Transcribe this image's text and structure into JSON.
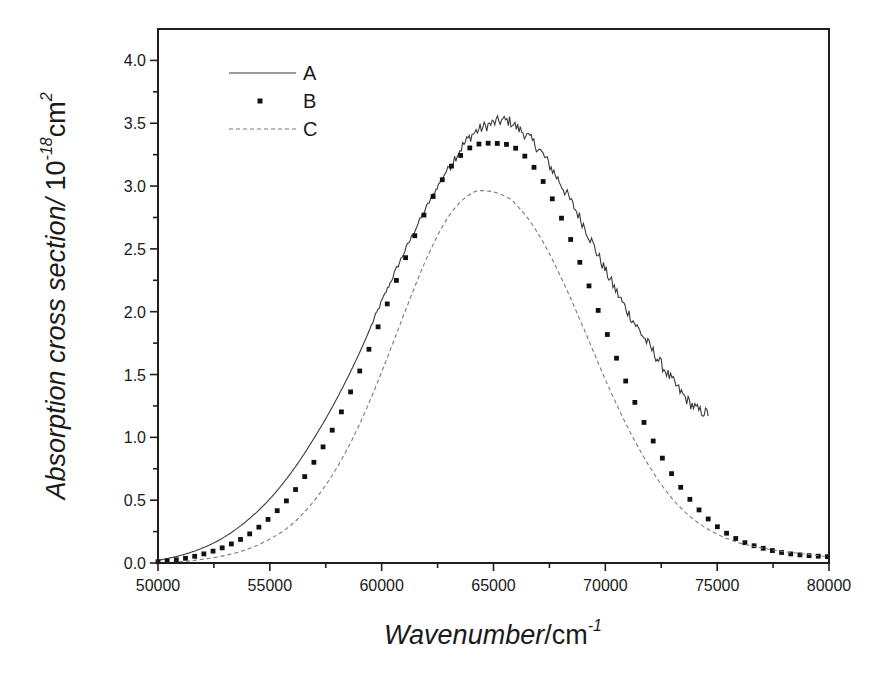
{
  "chart_data": {
    "type": "line",
    "title": "",
    "xlabel": "Wavenumber/cm⁻¹",
    "xlabel_parts": {
      "italic": "Wavenumber",
      "unit": "/cm",
      "sup": "-1"
    },
    "ylabel": "Absorption cross section/ 10⁻¹⁸cm²",
    "ylabel_parts": {
      "italic": "Absorption cross section/",
      "unit": " 10",
      "sup1": "-18",
      "unit2": "cm",
      "sup2": "2"
    },
    "xlim": [
      50000,
      80000
    ],
    "ylim": [
      0.0,
      4.25
    ],
    "x_ticks": [
      50000,
      55000,
      60000,
      65000,
      70000,
      75000,
      80000
    ],
    "x_tick_labels": [
      "50000",
      "55000",
      "60000",
      "65000",
      "70000",
      "75000",
      "80000"
    ],
    "x_minor_step": 2500,
    "y_ticks": [
      0.0,
      0.5,
      1.0,
      1.5,
      2.0,
      2.5,
      3.0,
      3.5,
      4.0
    ],
    "y_tick_labels": [
      "0.0",
      "0.5",
      "1.0",
      "1.5",
      "2.0",
      "2.5",
      "3.0",
      "3.5",
      "4.0"
    ],
    "y_minor_step": 0.25,
    "grid": false,
    "legend_position": "upper-left",
    "series": [
      {
        "name": "A",
        "style": "solid-noisy",
        "color": "#3a3a3a",
        "x": [
          50000,
          51000,
          52000,
          53000,
          54000,
          55000,
          56000,
          57000,
          58000,
          59000,
          60000,
          61000,
          62000,
          63000,
          64000,
          65000,
          65600,
          66000,
          67000,
          68000,
          69000,
          70000,
          71000,
          72000,
          73000,
          74000,
          74600
        ],
        "y": [
          0.02,
          0.06,
          0.12,
          0.21,
          0.34,
          0.51,
          0.73,
          1.0,
          1.31,
          1.67,
          2.08,
          2.47,
          2.83,
          3.15,
          3.4,
          3.5,
          3.52,
          3.47,
          3.3,
          3.02,
          2.7,
          2.33,
          2.0,
          1.72,
          1.45,
          1.24,
          1.19
        ]
      },
      {
        "name": "B",
        "style": "square-markers",
        "color": "#111111",
        "x": [
          50000,
          51000,
          52000,
          53000,
          54000,
          55000,
          56000,
          57000,
          58000,
          59000,
          60000,
          61000,
          62000,
          63000,
          64000,
          65000,
          66000,
          67000,
          68000,
          69000,
          70000,
          71000,
          72000,
          73000,
          74000,
          75000,
          76000,
          77000,
          78000,
          79000,
          80000
        ],
        "y": [
          0.01,
          0.03,
          0.07,
          0.13,
          0.22,
          0.36,
          0.55,
          0.81,
          1.13,
          1.52,
          1.95,
          2.4,
          2.81,
          3.13,
          3.31,
          3.34,
          3.3,
          3.1,
          2.76,
          2.33,
          1.86,
          1.41,
          1.02,
          0.7,
          0.46,
          0.29,
          0.18,
          0.12,
          0.08,
          0.06,
          0.05
        ]
      },
      {
        "name": "C",
        "style": "dashed",
        "color": "#7a7a7a",
        "x": [
          50000,
          51000,
          52000,
          53000,
          54000,
          55000,
          56000,
          57000,
          58000,
          59000,
          60000,
          61000,
          62000,
          63000,
          64000,
          64800,
          65500,
          66000,
          67000,
          68000,
          69000,
          70000,
          71000,
          72000,
          73000,
          74000,
          75000,
          76000,
          77000,
          78000,
          79000,
          80000
        ],
        "y": [
          0.0,
          0.01,
          0.03,
          0.06,
          0.11,
          0.19,
          0.31,
          0.5,
          0.76,
          1.1,
          1.52,
          1.98,
          2.42,
          2.76,
          2.94,
          2.96,
          2.92,
          2.85,
          2.62,
          2.28,
          1.88,
          1.46,
          1.08,
          0.76,
          0.51,
          0.34,
          0.23,
          0.16,
          0.12,
          0.09,
          0.07,
          0.05
        ]
      }
    ],
    "legend": [
      {
        "label": "A",
        "style": "solid"
      },
      {
        "label": "B",
        "style": "square-markers"
      },
      {
        "label": "C",
        "style": "dashed"
      }
    ]
  },
  "colors": {
    "axis": "#1e1e1e",
    "background": "#ffffff"
  },
  "layout": {
    "plot": {
      "left": 158,
      "top": 29,
      "right": 829,
      "bottom": 563
    }
  }
}
